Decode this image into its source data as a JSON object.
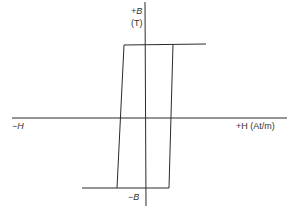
{
  "diagram": {
    "type": "hysteresis-loop",
    "labels": {
      "b_positive": "+B",
      "b_unit": "(T)",
      "b_negative": "−B",
      "h_negative": "−H",
      "h_positive": "+H (At/m)"
    },
    "colors": {
      "line": "#2a2a2a",
      "text": "#333333"
    },
    "geometry": {
      "origin": [
        145,
        118
      ],
      "h_axis": [
        12,
        287
      ],
      "b_axis": [
        2,
        206
      ],
      "top_line_y": 44,
      "bottom_line_y": 188,
      "loop_top_left_x": 124,
      "loop_top_right_x": 173,
      "loop_bottom_left_x": 117,
      "loop_bottom_right_x": 169,
      "top_extension_end_x": 206,
      "bottom_extension_start_x": 82
    }
  }
}
